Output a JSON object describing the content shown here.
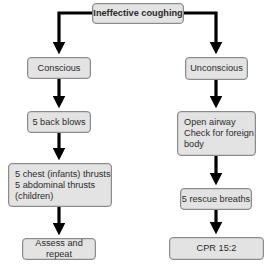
{
  "diagram": {
    "type": "flowchart",
    "colors": {
      "box_fill": "#e3e3e3",
      "box_border": "#8a8a8a",
      "arrow": "#000000",
      "text": "#2b2b2b"
    },
    "root": {
      "label": "Ineffective coughing"
    },
    "branches": {
      "left": {
        "label": "Conscious",
        "steps": [
          {
            "label": "5 back blows"
          },
          {
            "label": "5 chest (infants) thrusts\n5 abdominal thrusts\n(children)"
          },
          {
            "label": "Assess and repeat"
          }
        ]
      },
      "right": {
        "label": "Unconscious",
        "steps": [
          {
            "label": "Open airway\nCheck for foreign\nbody"
          },
          {
            "label": "5 rescue breaths"
          },
          {
            "label": "CPR 15:2"
          }
        ]
      }
    }
  }
}
